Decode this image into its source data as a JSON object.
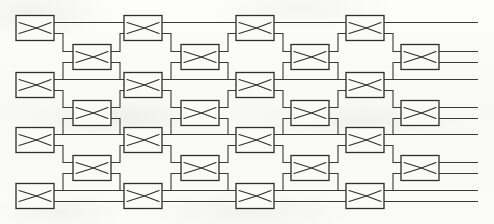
{
  "figure": {
    "width": 494,
    "height": 224,
    "background_color": "#fbfbfa",
    "line_color": "#3a3a3a",
    "box_fill_color": "#fafaf8",
    "box_stroke_color": "#2e2e2e",
    "element_icon_name": "crossbar-switch-icon",
    "counts": {
      "total_switch_elements": 29,
      "main_row_count": 4,
      "intermediate_row_count": 3,
      "main_column_count": 4,
      "intermediate_column_count": 4
    },
    "geometry": {
      "box_width": 38,
      "box_height": 25,
      "port_gap": 11,
      "stub_length": 9,
      "main_rows_y": [
        28,
        85,
        140,
        196
      ],
      "inter_rows_y": [
        57,
        113,
        168
      ],
      "main_cols_x": [
        35,
        143,
        255,
        365
      ],
      "inter_cols_x": [
        92,
        200,
        310,
        420
      ],
      "left_rail_x": 16,
      "right_rail_x": 478
    },
    "switch_elements": [
      {
        "name": "switch-r1c1",
        "row": 1,
        "col": 1,
        "x": 35,
        "y": 28,
        "stage": "main"
      },
      {
        "name": "switch-r1c2",
        "row": 1,
        "col": 2,
        "x": 143,
        "y": 28,
        "stage": "main"
      },
      {
        "name": "switch-r1c3",
        "row": 1,
        "col": 3,
        "x": 255,
        "y": 28,
        "stage": "main"
      },
      {
        "name": "switch-r1c4",
        "row": 1,
        "col": 4,
        "x": 365,
        "y": 28,
        "stage": "main"
      },
      {
        "name": "switch-i1c1",
        "row": 1,
        "col": 1,
        "x": 92,
        "y": 57,
        "stage": "intermediate"
      },
      {
        "name": "switch-i1c2",
        "row": 1,
        "col": 2,
        "x": 200,
        "y": 57,
        "stage": "intermediate"
      },
      {
        "name": "switch-i1c3",
        "row": 1,
        "col": 3,
        "x": 310,
        "y": 57,
        "stage": "intermediate"
      },
      {
        "name": "switch-i1c4",
        "row": 1,
        "col": 4,
        "x": 420,
        "y": 57,
        "stage": "intermediate"
      },
      {
        "name": "switch-r2c1",
        "row": 2,
        "col": 1,
        "x": 35,
        "y": 85,
        "stage": "main"
      },
      {
        "name": "switch-r2c2",
        "row": 2,
        "col": 2,
        "x": 143,
        "y": 85,
        "stage": "main"
      },
      {
        "name": "switch-r2c3",
        "row": 2,
        "col": 3,
        "x": 255,
        "y": 85,
        "stage": "main"
      },
      {
        "name": "switch-r2c4",
        "row": 2,
        "col": 4,
        "x": 365,
        "y": 85,
        "stage": "main"
      },
      {
        "name": "switch-i2c1",
        "row": 2,
        "col": 1,
        "x": 92,
        "y": 113,
        "stage": "intermediate"
      },
      {
        "name": "switch-i2c2",
        "row": 2,
        "col": 2,
        "x": 200,
        "y": 113,
        "stage": "intermediate"
      },
      {
        "name": "switch-i2c3",
        "row": 2,
        "col": 3,
        "x": 310,
        "y": 113,
        "stage": "intermediate"
      },
      {
        "name": "switch-i2c4",
        "row": 2,
        "col": 4,
        "x": 420,
        "y": 113,
        "stage": "intermediate"
      },
      {
        "name": "switch-r3c1",
        "row": 3,
        "col": 1,
        "x": 35,
        "y": 140,
        "stage": "main"
      },
      {
        "name": "switch-r3c2",
        "row": 3,
        "col": 2,
        "x": 143,
        "y": 140,
        "stage": "main"
      },
      {
        "name": "switch-r3c3",
        "row": 3,
        "col": 3,
        "x": 255,
        "y": 140,
        "stage": "main"
      },
      {
        "name": "switch-r3c4",
        "row": 3,
        "col": 4,
        "x": 365,
        "y": 140,
        "stage": "main"
      },
      {
        "name": "switch-i3c1",
        "row": 3,
        "col": 1,
        "x": 92,
        "y": 168,
        "stage": "intermediate"
      },
      {
        "name": "switch-i3c2",
        "row": 3,
        "col": 2,
        "x": 200,
        "y": 168,
        "stage": "intermediate"
      },
      {
        "name": "switch-i3c3",
        "row": 3,
        "col": 3,
        "x": 310,
        "y": 168,
        "stage": "intermediate"
      },
      {
        "name": "switch-i3c4",
        "row": 3,
        "col": 4,
        "x": 420,
        "y": 168,
        "stage": "intermediate"
      },
      {
        "name": "switch-r4c1",
        "row": 4,
        "col": 1,
        "x": 35,
        "y": 196,
        "stage": "main"
      },
      {
        "name": "switch-r4c2",
        "row": 4,
        "col": 2,
        "x": 143,
        "y": 196,
        "stage": "main"
      },
      {
        "name": "switch-r4c3",
        "row": 4,
        "col": 3,
        "x": 255,
        "y": 196,
        "stage": "main"
      },
      {
        "name": "switch-r4c4",
        "row": 4,
        "col": 4,
        "x": 365,
        "y": 196,
        "stage": "main"
      }
    ]
  }
}
